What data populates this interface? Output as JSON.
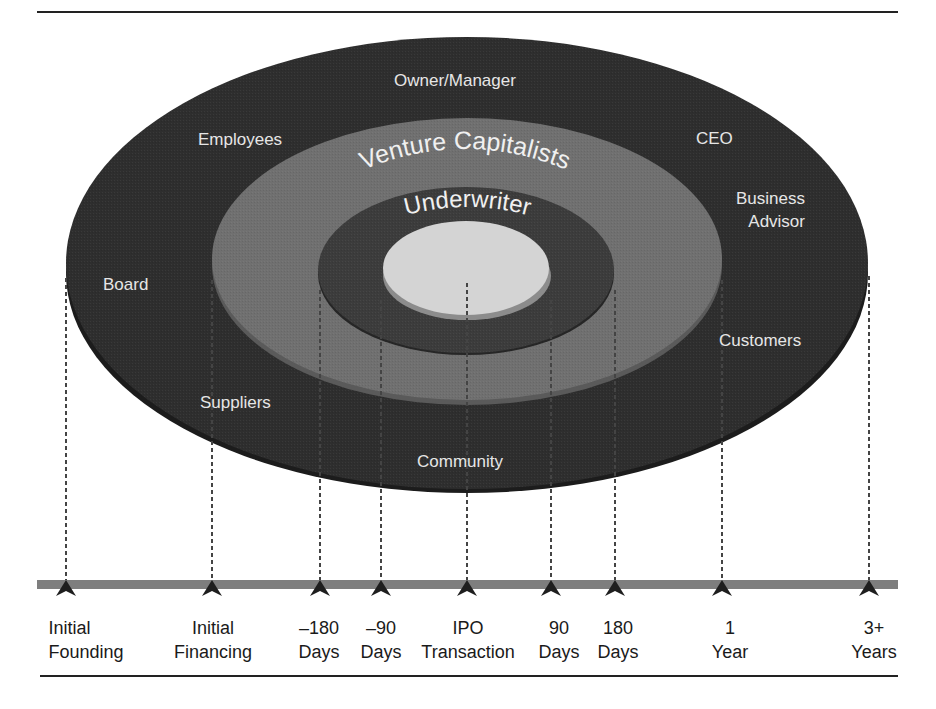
{
  "diagram": {
    "type": "concentric-stakeholder-timeline",
    "colors": {
      "outer_ring": "#2b2b2b",
      "outer_rim": "#1a1a1a",
      "vc_ring": "#6e6e6e",
      "underwriter_ring": "#3a3a3a",
      "core_top": "#d2d2d2",
      "core_side": "#8a8a8a",
      "timeline_bar": "#7a7a7a",
      "label_light": "#e8e8e8",
      "label_dark": "#1a1a1a"
    },
    "rings": {
      "outer": {
        "labels": [
          {
            "id": "owner-manager",
            "text": "Owner/Manager"
          },
          {
            "id": "employees",
            "text": "Employees"
          },
          {
            "id": "ceo",
            "text": "CEO"
          },
          {
            "id": "business-advisor",
            "lines": [
              "Business",
              "Advisor"
            ]
          },
          {
            "id": "board",
            "text": "Board"
          },
          {
            "id": "customers",
            "text": "Customers"
          },
          {
            "id": "suppliers",
            "text": "Suppliers"
          },
          {
            "id": "community",
            "text": "Community"
          }
        ]
      },
      "middle": {
        "label": "Venture Capitalists"
      },
      "inner": {
        "label": "Underwriter"
      },
      "core": {
        "label": ""
      }
    },
    "timeline": {
      "milestones": [
        {
          "line1": "Initial",
          "line2": "Founding"
        },
        {
          "line1": "Initial",
          "line2": "Financing"
        },
        {
          "line1": "–180",
          "line2": "Days"
        },
        {
          "line1": "–90",
          "line2": "Days"
        },
        {
          "line1": "IPO",
          "line2": "Transaction"
        },
        {
          "line1": "90",
          "line2": "Days"
        },
        {
          "line1": "180",
          "line2": "Days"
        },
        {
          "line1": "1",
          "line2": "Year"
        },
        {
          "line1": "3+",
          "line2": "Years"
        }
      ]
    }
  }
}
